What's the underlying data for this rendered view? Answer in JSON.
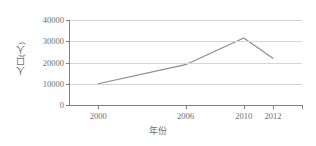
{
  "chart_data": {
    "type": "line",
    "title": "",
    "subtitle": "",
    "xlabel": "年份",
    "ylabel": "人口(人)",
    "x": [
      2000,
      2006,
      2010,
      2012
    ],
    "categories": [
      "2000",
      "2006",
      "2010",
      "2012"
    ],
    "values": [
      10000,
      19000,
      31500,
      22000
    ],
    "series": [
      {
        "name": "人口",
        "values": [
          10000,
          19000,
          31500,
          22000
        ]
      }
    ],
    "xlim": [
      1998,
      2014
    ],
    "ylim": [
      0,
      40000
    ],
    "x_ticks": [
      2000,
      2006,
      2010,
      2012
    ],
    "x_tick_labels": [
      "2000",
      "2006",
      "2010",
      "2012"
    ],
    "y_ticks": [
      0,
      10000,
      20000,
      30000,
      40000
    ],
    "y_tick_labels": [
      "0",
      "10000",
      "20000",
      "30000",
      "40000"
    ],
    "grid": "horizontal",
    "legend": "none",
    "markers": false,
    "colors": {
      "line": "#8a8b8d",
      "grid": "#d4d5d7",
      "axis": "#7d7e80",
      "text": "#6d6e71",
      "background": "#ffffff"
    }
  }
}
